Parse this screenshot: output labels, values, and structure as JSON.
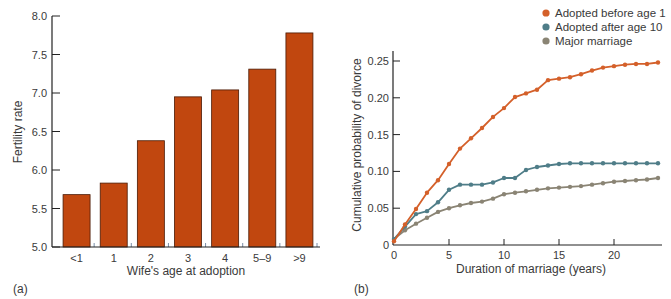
{
  "colors": {
    "bar_fill": "#c1470f",
    "bar_stroke": "#4a1a05",
    "axis": "#222222",
    "tick_minor": "#7a8ea8",
    "series_before1": "#d4602a",
    "series_after10": "#4f7d88",
    "series_major": "#8a8474"
  },
  "chart_data": [
    {
      "panel_label": "(a)",
      "type": "bar",
      "title": "",
      "xlabel": "Wife's age at adoption",
      "ylabel": "Fertility rate",
      "ylim": [
        5.0,
        8.0
      ],
      "yticks": [
        5.0,
        5.5,
        6.0,
        6.5,
        7.0,
        7.5,
        8.0
      ],
      "ytick_labels": [
        "5.0",
        "5.5",
        "6.0",
        "6.5",
        "7.0",
        "7.5",
        "8.0"
      ],
      "categories": [
        "<1",
        "1",
        "2",
        "3",
        "4",
        "5–9",
        ">9"
      ],
      "values": [
        5.68,
        5.83,
        6.38,
        6.95,
        7.04,
        7.31,
        7.78
      ],
      "grid": false,
      "legend": null
    },
    {
      "panel_label": "(b)",
      "type": "line",
      "title": "",
      "xlabel": "Duration of marriage (years)",
      "ylabel": "Cumulative probability of divorce",
      "xlim": [
        0,
        24
      ],
      "ylim": [
        0,
        0.26
      ],
      "xticks": [
        0,
        5,
        10,
        15,
        20
      ],
      "xtick_labels": [
        "0",
        "5",
        "10",
        "15",
        "20"
      ],
      "yticks": [
        0,
        0.05,
        0.1,
        0.15,
        0.2,
        0.25
      ],
      "ytick_labels": [
        "0",
        "0.05",
        "0.10",
        "0.15",
        "0.20",
        "0.25"
      ],
      "grid": false,
      "legend_position": "top-right, above plot",
      "x": [
        0,
        1,
        2,
        3,
        4,
        5,
        6,
        7,
        8,
        9,
        10,
        11,
        12,
        13,
        14,
        15,
        16,
        17,
        18,
        19,
        20,
        21,
        22,
        23,
        24
      ],
      "series": [
        {
          "name": "Adopted before age 1",
          "color_key": "series_before1",
          "values": [
            0.005,
            0.028,
            0.049,
            0.071,
            0.088,
            0.11,
            0.131,
            0.145,
            0.159,
            0.174,
            0.186,
            0.201,
            0.206,
            0.211,
            0.224,
            0.226,
            0.228,
            0.232,
            0.237,
            0.241,
            0.243,
            0.245,
            0.246,
            0.246,
            0.248
          ]
        },
        {
          "name": "Adopted after age 10",
          "color_key": "series_after10",
          "values": [
            0.008,
            0.025,
            0.042,
            0.046,
            0.058,
            0.075,
            0.082,
            0.082,
            0.082,
            0.085,
            0.091,
            0.091,
            0.102,
            0.106,
            0.108,
            0.11,
            0.111,
            0.111,
            0.111,
            0.111,
            0.111,
            0.111,
            0.111,
            0.111,
            0.111
          ]
        },
        {
          "name": "Major marriage",
          "color_key": "series_major",
          "values": [
            0.008,
            0.02,
            0.029,
            0.037,
            0.045,
            0.05,
            0.054,
            0.057,
            0.059,
            0.063,
            0.069,
            0.071,
            0.073,
            0.075,
            0.077,
            0.078,
            0.079,
            0.08,
            0.082,
            0.084,
            0.086,
            0.087,
            0.088,
            0.089,
            0.091
          ]
        }
      ]
    }
  ]
}
